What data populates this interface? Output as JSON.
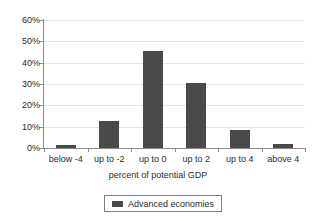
{
  "chart_data": {
    "type": "bar",
    "title": "",
    "subtitle": "",
    "xlabel": "percent of potential GDP",
    "ylabel": "",
    "categories": [
      "below -4",
      "up to -2",
      "up to 0",
      "up to 2",
      "up to 4",
      "above 4"
    ],
    "values": [
      1.5,
      12.5,
      45.6,
      30.5,
      8.5,
      1.8
    ],
    "series": [
      {
        "name": "Advanced economies",
        "values": [
          1.5,
          12.5,
          45.6,
          30.5,
          8.5,
          1.8
        ],
        "color": "#4a4a4a"
      }
    ],
    "ylim": [
      0,
      60
    ],
    "ytick_values": [
      0,
      10,
      20,
      30,
      40,
      50,
      60
    ],
    "ytick_labels": [
      "0%",
      "10%",
      "20%",
      "30%",
      "40%",
      "50%",
      "60%"
    ],
    "grid": "horizontal",
    "legend_position": "bottom-center",
    "legend_entries": [
      "Advanced economies"
    ]
  },
  "axes": {
    "x_title": "percent of potential GDP",
    "x_categories": [
      "below -4",
      "up to -2",
      "up to 0",
      "up to 2",
      "up to 4",
      "above 4"
    ],
    "y_ticks": [
      "60%",
      "50%",
      "40%",
      "30%",
      "20%",
      "10%",
      "0%"
    ]
  },
  "legend": {
    "items": [
      {
        "label": "Advanced economies",
        "color": "#4a4a4a"
      }
    ]
  },
  "colors": {
    "bar": "#4a4a4a",
    "grid": "#e4e4e8",
    "axis": "#8c8c8c",
    "text": "#2b2b2b",
    "background": "#ffffff"
  }
}
